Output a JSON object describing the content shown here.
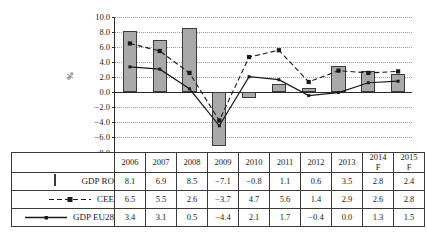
{
  "chart_data": {
    "type": "bar",
    "title": "",
    "xlabel": "",
    "ylabel": "%",
    "ylim": [
      -8.0,
      10.0
    ],
    "grid": true,
    "legend_position": "table-left",
    "categories": [
      "2006",
      "2007",
      "2008",
      "2009",
      "2010",
      "2011",
      "2012",
      "2013",
      "2014 F",
      "2015 F"
    ],
    "ytick_labels": [
      "10.0",
      "8.0",
      "6.0",
      "4.0",
      "2.0",
      "0.0",
      "−2.0",
      "−4.0",
      "−6.0",
      "−8.0"
    ],
    "ytick_values": [
      10.0,
      8.0,
      6.0,
      4.0,
      2.0,
      0.0,
      -2.0,
      -4.0,
      -6.0,
      -8.0
    ],
    "series": [
      {
        "name": "GDP RO",
        "render": "bar",
        "color": "#a9a9a9",
        "values": [
          8.1,
          6.9,
          8.5,
          -7.1,
          -0.8,
          1.1,
          0.6,
          3.5,
          2.8,
          2.4
        ]
      },
      {
        "name": "CEE",
        "render": "dashed-line",
        "color": "#1a1a1a",
        "values": [
          6.5,
          5.5,
          2.6,
          -3.7,
          4.7,
          5.6,
          1.4,
          2.9,
          2.6,
          2.8
        ]
      },
      {
        "name": "GDP EU28",
        "render": "solid-line",
        "color": "#1a1a1a",
        "values": [
          3.4,
          3.1,
          0.5,
          -4.4,
          2.1,
          1.7,
          -0.4,
          0.0,
          1.3,
          1.5
        ]
      }
    ]
  },
  "table": {
    "header_blank": "",
    "year_headers": [
      {
        "line1": "2006",
        "line2": ""
      },
      {
        "line1": "2007",
        "line2": ""
      },
      {
        "line1": "2008",
        "line2": ""
      },
      {
        "line1": "2009",
        "line2": ""
      },
      {
        "line1": "2010",
        "line2": ""
      },
      {
        "line1": "2011",
        "line2": ""
      },
      {
        "line1": "2012",
        "line2": ""
      },
      {
        "line1": "2013",
        "line2": ""
      },
      {
        "line1": "2014",
        "line2": "F"
      },
      {
        "line1": "2015",
        "line2": "F"
      }
    ],
    "rows": [
      {
        "label": "GDP RO",
        "marker": "bar-swatch",
        "cells": [
          "8.1",
          "6.9",
          "8.5",
          "−7.1",
          "−0.8",
          "1.1",
          "0.6",
          "3.5",
          "2.8",
          "2.4"
        ]
      },
      {
        "label": "CEE",
        "marker": "dashed-square-swatch",
        "cells": [
          "6.5",
          "5.5",
          "2.6",
          "−3.7",
          "4.7",
          "5.6",
          "1.4",
          "2.9",
          "2.6",
          "2.8"
        ]
      },
      {
        "label": "GDP EU28",
        "marker": "solid-square-swatch",
        "cells": [
          "3.4",
          "3.1",
          "0.5",
          "−4.4",
          "2.1",
          "1.7",
          "−0.4",
          "0.0",
          "1.3",
          "1.5"
        ]
      }
    ]
  },
  "colors": {
    "bar_fill": "#a9a9a9",
    "bar_stroke": "#3b3b3b",
    "line": "#1a1a1a",
    "grid": "#9a9a9a",
    "axis": "#2a2a2a"
  }
}
